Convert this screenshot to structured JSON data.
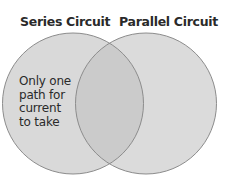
{
  "diagram": {
    "type": "venn",
    "sets": [
      {
        "id": "left",
        "title": "Series Circuit",
        "unique_items": [
          "Only one",
          "path for",
          "current",
          "to take"
        ]
      },
      {
        "id": "right",
        "title": "Parallel Circuit",
        "unique_items": []
      }
    ],
    "overlap_items": [],
    "colors": {
      "circle_fill": "#d9d9d9",
      "overlap_fill": "#cbcbcb",
      "circle_stroke": "#8c8c8c",
      "background": "#ffffff",
      "text": "#2a2a2a"
    }
  }
}
